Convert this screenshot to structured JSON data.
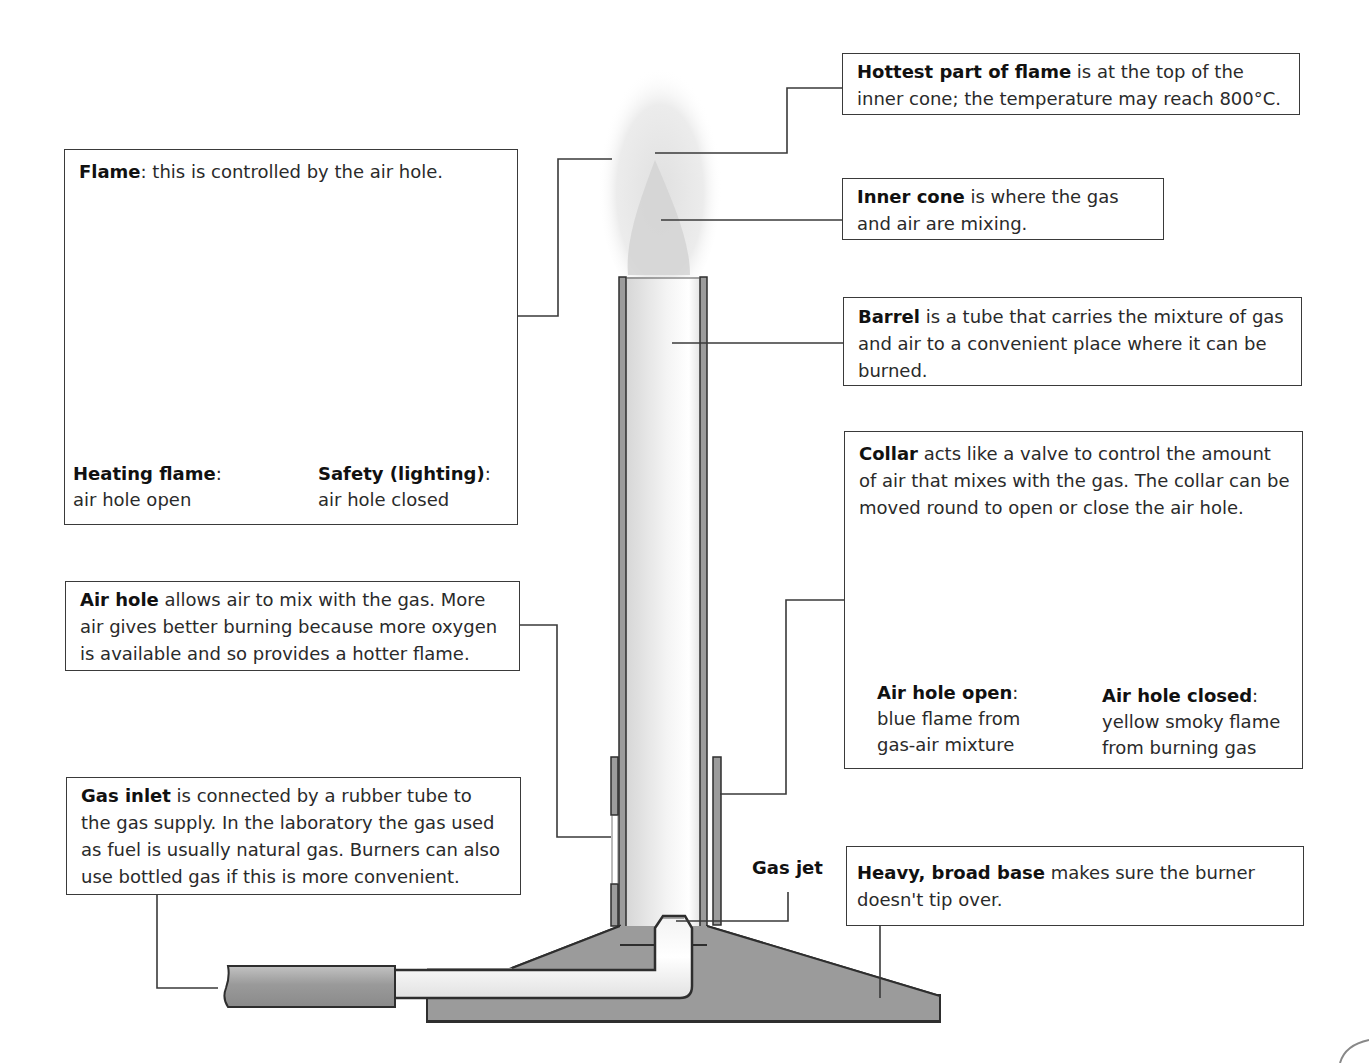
{
  "labels": {
    "hottest": {
      "term": "Hottest part of flame",
      "text": " is at the top of the inner cone; the temperature may reach 800°C."
    },
    "inner_cone": {
      "term": "Inner cone",
      "text": " is where the gas and air are mixing."
    },
    "barrel": {
      "term": "Barrel",
      "text": " is a tube that carries the mixture of gas and air to a convenient place where it can be burned."
    },
    "collar": {
      "term": "Collar",
      "text": " acts like a valve to control the amount of air that mixes with the gas. The collar can be moved round to open or close the air hole."
    },
    "flame": {
      "term": "Flame",
      "text": ": this is controlled by the air hole."
    },
    "air_hole": {
      "term": "Air hole",
      "text": " allows air to mix with the gas. More air gives better burning because more oxygen is available and so provides a hotter flame."
    },
    "gas_inlet": {
      "term": "Gas inlet",
      "text": " is connected by a rubber tube to the gas supply. In the laboratory the gas used as fuel is usually natural gas. Burners can also use bottled gas if this is more convenient."
    },
    "base": {
      "term": "Heavy, broad base",
      "text": " makes sure the burner doesn't tip over."
    },
    "gas_jet": {
      "term": "Gas jet"
    }
  },
  "flame_panel": {
    "heating": {
      "term": "Heating flame",
      "colon": ":",
      "desc": "air hole open"
    },
    "safety": {
      "term": "Safety (lighting)",
      "colon": ":",
      "desc": "air hole closed"
    }
  },
  "collar_panel": {
    "open": {
      "term": "Air hole open",
      "colon": ":",
      "desc1": "blue flame from",
      "desc2": "gas-air mixture"
    },
    "closed": {
      "term": "Air hole closed",
      "colon": ":",
      "desc1": "yellow smoky flame",
      "desc2": "from burning gas"
    }
  },
  "colors": {
    "outline": "#2e2e2e",
    "metal_dark": "#8f8f8f",
    "metal_light": "#e9e9e9",
    "flame": "#cfcfcf"
  }
}
